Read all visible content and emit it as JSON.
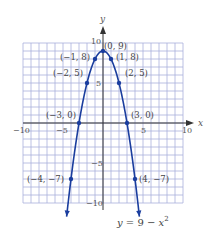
{
  "chart_data": {
    "type": "line",
    "title": "",
    "equation": "y = 9 − x²",
    "equation_parts": {
      "lhs": "y",
      "mid": " = 9 − ",
      "var": "x",
      "exp": "2"
    },
    "xlabel": "x",
    "ylabel": "y",
    "xlim": [
      -10,
      10
    ],
    "ylim": [
      -10,
      10
    ],
    "grid": true,
    "x_ticks": [
      {
        "value": -10,
        "label": "−10"
      },
      {
        "value": -5,
        "label": "−5"
      },
      {
        "value": 5,
        "label": "5"
      },
      {
        "value": 10,
        "label": "10"
      }
    ],
    "y_ticks": [
      {
        "value": 10,
        "label": "10"
      },
      {
        "value": 5,
        "label": "5"
      },
      {
        "value": -5,
        "label": "−5"
      },
      {
        "value": -10,
        "label": "−10"
      }
    ],
    "series": [
      {
        "name": "y = 9 − x²",
        "color": "#1a3d9e",
        "function": "9 - x^2",
        "x_range": [
          -4.55,
          4.55
        ]
      }
    ],
    "points": [
      {
        "x": 0,
        "y": 9,
        "label": "(0, 9)"
      },
      {
        "x": -1,
        "y": 8,
        "label": "(−1, 8)"
      },
      {
        "x": 1,
        "y": 8,
        "label": "(1, 8)"
      },
      {
        "x": -2,
        "y": 5,
        "label": "(−2, 5)"
      },
      {
        "x": 2,
        "y": 5,
        "label": "(2, 5)"
      },
      {
        "x": -3,
        "y": 0,
        "label": "(−3, 0)"
      },
      {
        "x": 3,
        "y": 0,
        "label": "(3, 0)"
      },
      {
        "x": -4,
        "y": -7,
        "label": "(−4, −7)"
      },
      {
        "x": 4,
        "y": -7,
        "label": "(4, −7)"
      }
    ]
  },
  "colors": {
    "grid": "#aab0dc",
    "axis": "#333333",
    "curve": "#1a3d9e"
  }
}
